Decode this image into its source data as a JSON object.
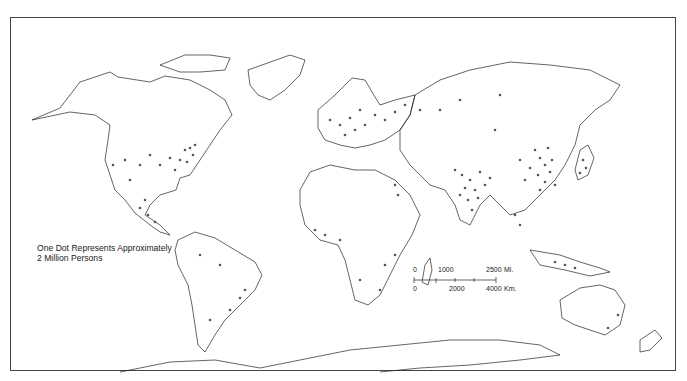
{
  "map": {
    "type": "dot-density world population map",
    "projection": "world (Robinson-like)",
    "legend": {
      "line1": "One Dot Represents Approximately",
      "line2": "2 Million Persons",
      "dot_value_persons": 2000000
    },
    "scale_bar": {
      "miles_labels": [
        "0",
        "1000",
        "2500",
        "Mi."
      ],
      "km_labels": [
        "0",
        "2000",
        "4000",
        "Km."
      ]
    },
    "colors": {
      "outline": "#222222",
      "dot": "#555555",
      "background": "#ffffff",
      "frame": "#444444"
    },
    "dense_regions": [
      "Eastern China",
      "India",
      "Japan",
      "Java",
      "Europe",
      "Eastern United States",
      "Nile Valley",
      "West Africa",
      "Southeast Brazil",
      "Central Mexico"
    ]
  }
}
